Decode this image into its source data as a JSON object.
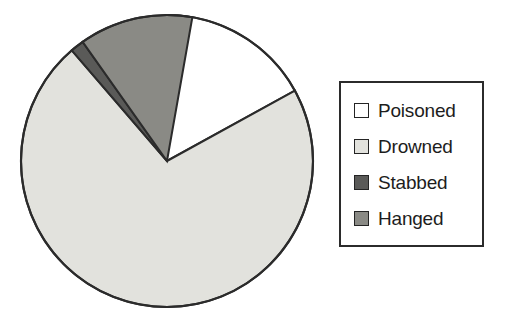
{
  "chart_data": {
    "type": "pie",
    "title": "",
    "subtitle": "",
    "xlabel": "",
    "ylabel": "",
    "grid": false,
    "legend_position": "right",
    "start_angle_deg": 0,
    "direction": "clockwise",
    "categories": [
      "Poisoned",
      "Drowned",
      "Stabbed",
      "Hanged"
    ],
    "values": [
      17.0,
      71.7,
      1.5,
      12.6
    ],
    "value_unit": "percent",
    "slice_angles_deg": [
      61.2,
      258.1,
      5.4,
      45.3
    ],
    "colors": [
      "#ffffff",
      "#e2e2dd",
      "#5a5a58",
      "#8a8a85"
    ],
    "slices": [
      {
        "label": "Poisoned",
        "value": 17.0,
        "angle_deg": 61.2,
        "color": "#ffffff"
      },
      {
        "label": "Drowned",
        "value": 71.7,
        "angle_deg": 258.1,
        "color": "#e2e2dd"
      },
      {
        "label": "Stabbed",
        "value": 1.5,
        "angle_deg": 5.4,
        "color": "#5a5a58"
      },
      {
        "label": "Hanged",
        "value": 12.6,
        "angle_deg": 45.3,
        "color": "#8a8a85"
      }
    ]
  },
  "legend": {
    "items": [
      {
        "label": "Poisoned",
        "color": "#ffffff"
      },
      {
        "label": "Drowned",
        "color": "#e2e2dd"
      },
      {
        "label": "Stabbed",
        "color": "#5a5a58"
      },
      {
        "label": "Hanged",
        "color": "#8a8a85"
      }
    ]
  },
  "style": {
    "background": "#ffffff",
    "outline": "#2b2b2b",
    "text": "#1d1d1d"
  }
}
